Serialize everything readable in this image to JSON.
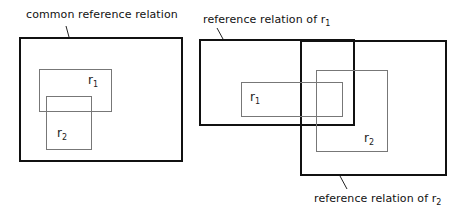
{
  "left_diagram": {
    "label": "common reference relation",
    "regions": [
      {
        "name": "r",
        "sub": "1"
      },
      {
        "name": "r",
        "sub": "2"
      }
    ]
  },
  "right_diagram": {
    "label_top_prefix": "reference relation  of r",
    "label_top_sub": "1",
    "label_bottom_prefix": "reference relation  of r",
    "label_bottom_sub": "2",
    "regions": [
      {
        "name": "r",
        "sub": "1"
      },
      {
        "name": "r",
        "sub": "2"
      }
    ]
  }
}
